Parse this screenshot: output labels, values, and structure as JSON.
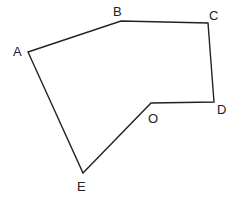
{
  "diagram": {
    "type": "polygon",
    "stroke_color": "#222222",
    "background": "#ffffff",
    "vertices": [
      {
        "label": "A",
        "x": 28,
        "y": 52,
        "lx": 13,
        "ly": 56
      },
      {
        "label": "B",
        "x": 121,
        "y": 21,
        "lx": 113,
        "ly": 16
      },
      {
        "label": "C",
        "x": 208,
        "y": 23,
        "lx": 209,
        "ly": 20
      },
      {
        "label": "D",
        "x": 214,
        "y": 102,
        "lx": 217,
        "ly": 114
      },
      {
        "label": "O",
        "x": 151,
        "y": 103,
        "lx": 148,
        "ly": 123
      },
      {
        "label": "E",
        "x": 83,
        "y": 173,
        "lx": 77,
        "ly": 191
      }
    ],
    "labels": {
      "A": "A",
      "B": "B",
      "C": "C",
      "D": "D",
      "O": "O",
      "E": "E"
    }
  }
}
